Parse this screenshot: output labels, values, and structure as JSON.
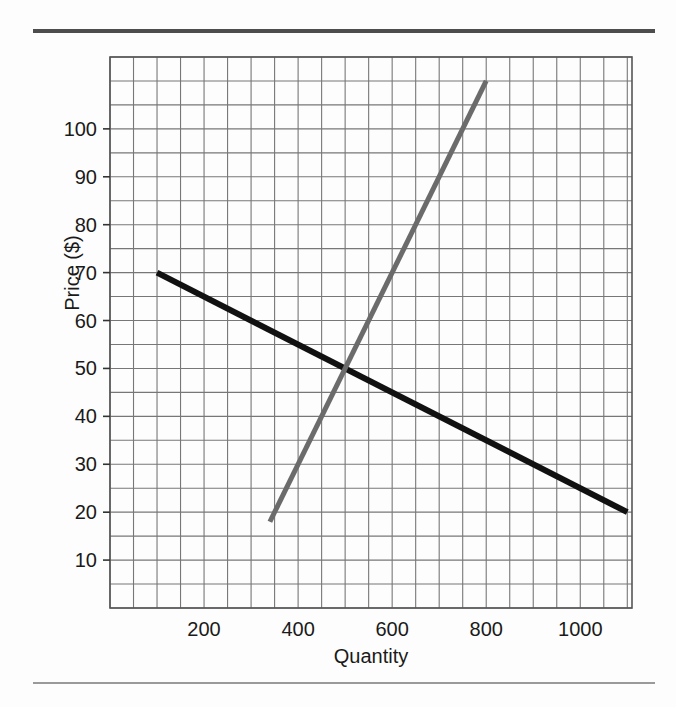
{
  "figure": {
    "kind": "economics-supply-demand-graph",
    "background_color": "#fdfdfd",
    "rule_color_top": "#4d4d4d",
    "rule_color_bottom": "#9a9a9a"
  },
  "chart_data": {
    "type": "line",
    "title": "",
    "subtitle": "",
    "xlabel": "Quantity",
    "ylabel": "Price ($)",
    "xlim": [
      0,
      1110
    ],
    "ylim": [
      0,
      115
    ],
    "grid": true,
    "grid_color": "#777777",
    "grid_step_x": 50,
    "grid_step_y": 5,
    "legend_position": "none",
    "xticks": [
      200,
      400,
      600,
      800,
      1000
    ],
    "xtick_labels": [
      "200",
      "400",
      "600",
      "800",
      "1000"
    ],
    "yticks": [
      10,
      20,
      30,
      40,
      50,
      60,
      70,
      80,
      90,
      100
    ],
    "ytick_labels": [
      "10",
      "20",
      "30",
      "40",
      "50",
      "60",
      "70",
      "80",
      "90",
      "100"
    ],
    "series": [
      {
        "name": "Demand",
        "color": "#111111",
        "line_width": 6,
        "points": [
          {
            "x": 100,
            "y": 70
          },
          {
            "x": 1100,
            "y": 20
          }
        ],
        "values": [
          70,
          20
        ],
        "x": [
          100,
          1100
        ]
      },
      {
        "name": "Supply",
        "color": "#6b6b6b",
        "line_width": 5,
        "points": [
          {
            "x": 340,
            "y": 18
          },
          {
            "x": 800,
            "y": 110
          }
        ],
        "values": [
          18,
          110
        ],
        "x": [
          340,
          800
        ]
      }
    ],
    "annotations": [
      {
        "label": "equilibrium",
        "x": 500,
        "y": 50
      }
    ]
  }
}
